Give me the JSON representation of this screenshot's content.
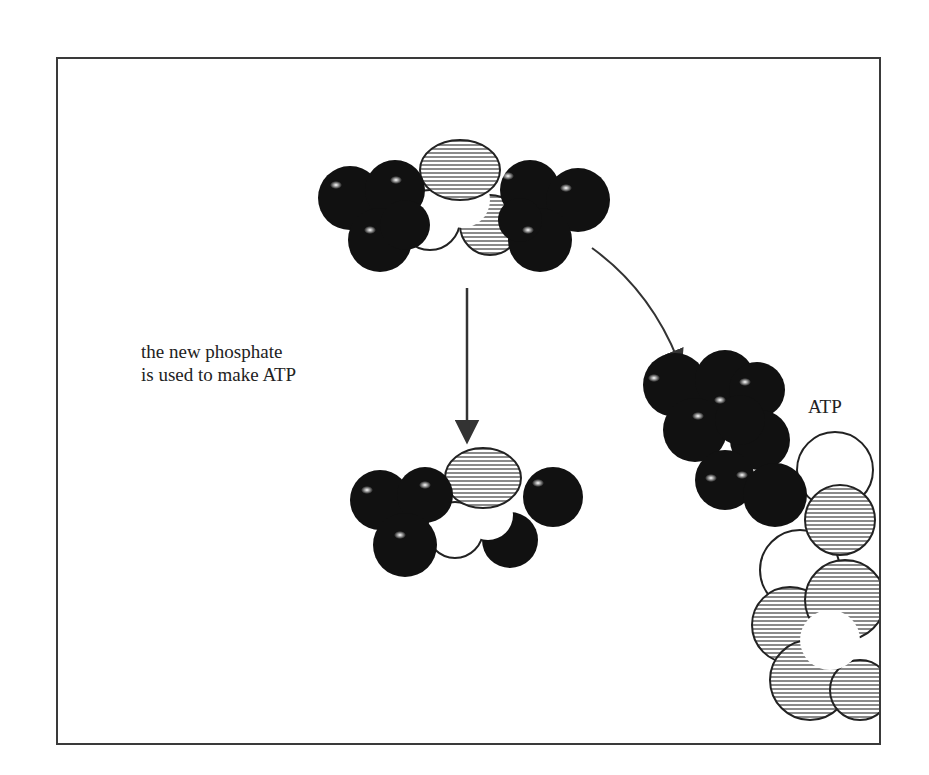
{
  "diagram": {
    "caption": {
      "line1": "the new phosphate",
      "line2": "is used to make ATP"
    },
    "labels": {
      "atp": "ATP"
    },
    "molecules": [
      {
        "id": "top-molecule",
        "role": "phosphate donor (before)"
      },
      {
        "id": "bottom-molecule",
        "role": "donor after phosphate transfer"
      },
      {
        "id": "atp-molecule",
        "role": "ATP formed"
      }
    ],
    "arrows": [
      {
        "id": "down-arrow",
        "from": "top-molecule",
        "to": "bottom-molecule"
      },
      {
        "id": "curved-arrow",
        "from": "top-molecule",
        "to": "atp-molecule"
      }
    ],
    "colors": {
      "dark": "#111111",
      "hatch": "#9a9a9a",
      "outline": "#222222",
      "frame": "#3a3a3a"
    }
  }
}
